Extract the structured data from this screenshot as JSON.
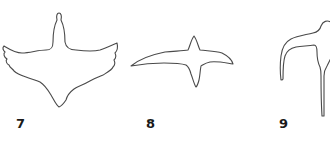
{
  "figures": [
    {
      "label": "7",
      "shape": "bird-silhouette-wings-spread-front-view"
    },
    {
      "label": "8",
      "shape": "bird-silhouette-gliding-top-view"
    },
    {
      "label": "9",
      "shape": "bird-silhouette-partial-side-view"
    }
  ],
  "colors": {
    "outline": "#4a4a4a",
    "label": "#1a1a1a",
    "background": "#ffffff"
  }
}
